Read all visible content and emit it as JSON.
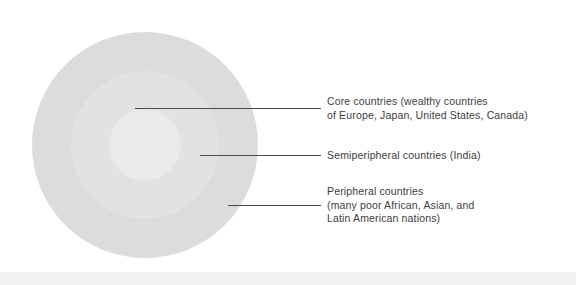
{
  "diagram": {
    "type": "concentric-circles",
    "zones": [
      {
        "id": "peripheral",
        "name": "Peripheral countries",
        "label": "Peripheral countries\n(many poor African, Asian, and\nLatin American nations)",
        "color": "#dcdcdc",
        "diameter_px": 226,
        "ring_order": 3
      },
      {
        "id": "semiperipheral",
        "name": "Semiperipheral countries",
        "label": "Semiperipheral countries (India)",
        "color": "#e2e2e2",
        "diameter_px": 148,
        "ring_order": 2
      },
      {
        "id": "core",
        "name": "Core countries",
        "label": "Core countries (wealthy countries\nof Europe, Japan, United States, Canada)",
        "color": "#eaeaea",
        "diameter_px": 72,
        "ring_order": 1
      }
    ],
    "leader_line_color": "#4a4a4a",
    "background_color": "#ffffff",
    "text_color": "#3d3d3d"
  }
}
